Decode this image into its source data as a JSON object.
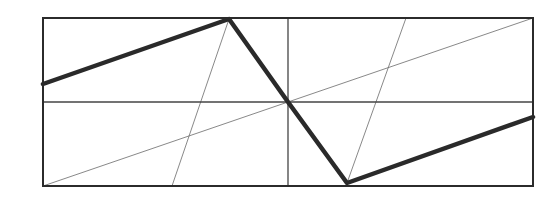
{
  "diagram": {
    "canvas": {
      "width": 560,
      "height": 207,
      "background": "#ffffff"
    },
    "colors": {
      "frame": "#2b2b2b",
      "thick_line": "#2a2a2a",
      "midlines": "#444444",
      "construction": "#6a6a6a"
    },
    "frame": {
      "x1": 43,
      "y1": 18,
      "x2": 533,
      "y2": 186,
      "stroke_width": 2
    },
    "midlines": {
      "horizontal": {
        "x1": 43,
        "y1": 102,
        "x2": 533,
        "y2": 102,
        "stroke_width": 1.3
      },
      "vertical": {
        "x1": 288,
        "y1": 18,
        "x2": 288,
        "y2": 186,
        "stroke_width": 1.3
      }
    },
    "thick_polyline": {
      "points": [
        [
          43,
          84
        ],
        [
          229,
          19
        ],
        [
          288,
          102
        ],
        [
          347,
          183
        ],
        [
          533,
          117
        ]
      ],
      "stroke_width": 4.5
    },
    "thin_lines": [
      {
        "name": "long-diagonal",
        "x1": 43,
        "y1": 186,
        "x2": 533,
        "y2": 18,
        "stroke_width": 0.8
      },
      {
        "name": "left-steep-line",
        "x1": 172,
        "y1": 186,
        "x2": 229,
        "y2": 19,
        "stroke_width": 0.8
      },
      {
        "name": "right-steep-line",
        "x1": 347,
        "y1": 183,
        "x2": 406,
        "y2": 18,
        "stroke_width": 0.8
      }
    ]
  }
}
